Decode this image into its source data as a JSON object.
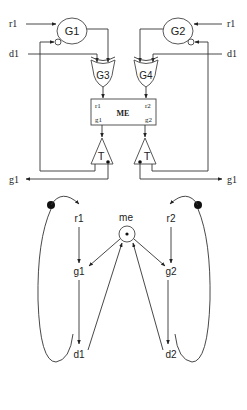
{
  "circuit": {
    "inputs": {
      "left_r": "r1",
      "left_d": "d1",
      "right_r": "r1",
      "right_d": "d1"
    },
    "gates": {
      "g1": "G1",
      "g2": "G2",
      "g3": "G3",
      "g4": "G4"
    },
    "mutex": {
      "title": "ME",
      "r1": "r1",
      "r2": "r2",
      "g1": "g1",
      "g2": "g2"
    },
    "toggles": {
      "left": "T",
      "right": "T"
    },
    "outputs": {
      "left": "g1",
      "right": "g1"
    }
  },
  "graph": {
    "nodes": {
      "me": "me",
      "r1": "r1",
      "g1": "g1",
      "d1": "d1",
      "r2": "r2",
      "g2": "g2",
      "d2": "d2"
    }
  }
}
